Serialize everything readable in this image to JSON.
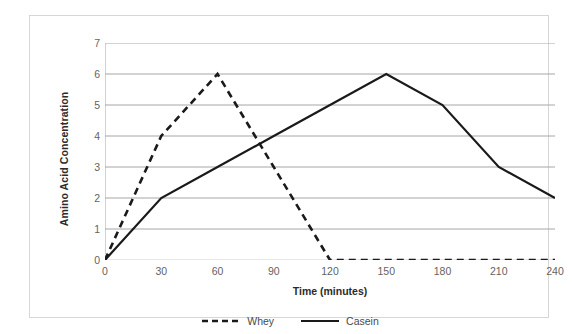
{
  "chart_data": {
    "type": "line",
    "title": "",
    "xlabel": "Time (minutes)",
    "ylabel": "Amino Acid Concentration",
    "x": [
      0,
      30,
      60,
      90,
      120,
      150,
      180,
      210,
      240
    ],
    "xticklabels": [
      "0",
      "30",
      "60",
      "90",
      "120",
      "150",
      "180",
      "210",
      "240"
    ],
    "yticklabels": [
      "0",
      "1",
      "2",
      "3",
      "4",
      "5",
      "6",
      "7"
    ],
    "xlim": [
      0,
      240
    ],
    "ylim": [
      0,
      7
    ],
    "grid": "horizontal",
    "legend_position": "bottom-center",
    "series": [
      {
        "name": "Whey",
        "style": "dashed",
        "color": "#1a1a1a",
        "values": [
          0,
          4,
          6,
          3,
          0,
          0,
          0,
          0,
          0
        ]
      },
      {
        "name": "Casein",
        "style": "solid",
        "color": "#1a1a1a",
        "values": [
          0,
          2,
          3,
          4,
          5,
          6,
          5,
          3,
          2
        ]
      }
    ]
  }
}
